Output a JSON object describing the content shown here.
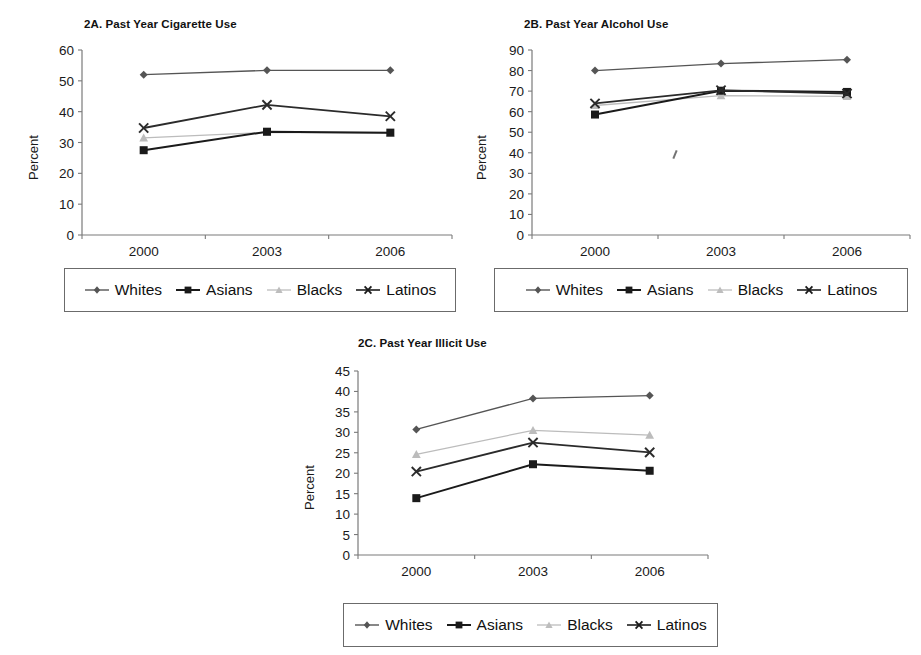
{
  "figure": {
    "background_color": "#ffffff",
    "series_styles": [
      {
        "name": "Whites",
        "marker": "diamond",
        "color": "#555555",
        "line_width": 1.3
      },
      {
        "name": "Asians",
        "marker": "square",
        "color": "#1a1a1a",
        "line_width": 2.0
      },
      {
        "name": "Blacks",
        "marker": "triangle",
        "color": "#bcbcbc",
        "line_width": 1.3
      },
      {
        "name": "Latinos",
        "marker": "x",
        "color": "#2b2b2b",
        "line_width": 1.8
      }
    ],
    "legend_labels": [
      "Whites",
      "Asians",
      "Blacks",
      "Latinos"
    ],
    "axis_label_y": "Percent"
  },
  "chart_data": [
    {
      "id": "2A",
      "type": "line",
      "title": "2A. Past Year Cigarette Use",
      "xlabel": "",
      "ylabel": "Percent",
      "categories": [
        "2000",
        "2003",
        "2006"
      ],
      "x": [
        2000,
        2003,
        2006
      ],
      "ylim": [
        0,
        60
      ],
      "yticks": [
        0,
        10,
        20,
        30,
        40,
        50,
        60
      ],
      "grid": false,
      "legend_position": "below",
      "series": [
        {
          "name": "Whites",
          "values": [
            52.0,
            53.4,
            53.4
          ]
        },
        {
          "name": "Asians",
          "values": [
            27.5,
            33.5,
            33.2
          ]
        },
        {
          "name": "Blacks",
          "values": [
            31.5,
            33.3,
            33.0
          ]
        },
        {
          "name": "Latinos",
          "values": [
            34.7,
            42.2,
            38.5
          ]
        }
      ]
    },
    {
      "id": "2B",
      "type": "line",
      "title": "2B. Past Year Alcohol Use",
      "xlabel": "",
      "ylabel": "Percent",
      "categories": [
        "2000",
        "2003",
        "2006"
      ],
      "x": [
        2000,
        2003,
        2006
      ],
      "ylim": [
        0,
        90
      ],
      "yticks": [
        0,
        10,
        20,
        30,
        40,
        50,
        60,
        70,
        80,
        90
      ],
      "grid": false,
      "legend_position": "below",
      "series": [
        {
          "name": "Whites",
          "values": [
            80.0,
            83.4,
            85.3
          ]
        },
        {
          "name": "Asians",
          "values": [
            58.6,
            70.2,
            69.6
          ]
        },
        {
          "name": "Blacks",
          "values": [
            63.0,
            67.8,
            67.4
          ]
        },
        {
          "name": "Latinos",
          "values": [
            64.0,
            70.4,
            68.8
          ]
        }
      ]
    },
    {
      "id": "2C",
      "type": "line",
      "title": "2C. Past Year Illicit Use",
      "xlabel": "",
      "ylabel": "Percent",
      "categories": [
        "2000",
        "2003",
        "2006"
      ],
      "x": [
        2000,
        2003,
        2006
      ],
      "ylim": [
        0,
        45
      ],
      "yticks": [
        0,
        5,
        10,
        15,
        20,
        25,
        30,
        35,
        40,
        45
      ],
      "grid": false,
      "legend_position": "below",
      "series": [
        {
          "name": "Whites",
          "values": [
            30.7,
            38.3,
            39.0
          ]
        },
        {
          "name": "Asians",
          "values": [
            13.9,
            22.2,
            20.6
          ]
        },
        {
          "name": "Blacks",
          "values": [
            24.6,
            30.5,
            29.3
          ]
        },
        {
          "name": "Latinos",
          "values": [
            20.4,
            27.5,
            25.1
          ]
        }
      ]
    }
  ]
}
